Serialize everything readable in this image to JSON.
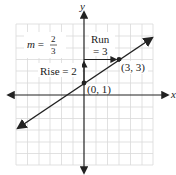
{
  "graph": {
    "axes": {
      "x_label": "x",
      "y_label": "y"
    },
    "grid": {
      "x_min": -6,
      "x_max": 6,
      "y_min": -6,
      "y_max": 6
    },
    "line": {
      "slope_text": "m =",
      "slope_num": "2",
      "slope_den": "3",
      "equation_slope": "2/3",
      "y_intercept": 1
    },
    "points": [
      {
        "label": "(0, 1)",
        "x": 0,
        "y": 1
      },
      {
        "label": "(3, 3)",
        "x": 3,
        "y": 3
      }
    ],
    "rise": {
      "label": "Rise = 2",
      "value": 2
    },
    "run": {
      "label_line1": "Run",
      "label_line2": "= 3",
      "value": 3
    }
  },
  "colors": {
    "grid": "#d9d9d9",
    "axis": "#222222",
    "line": "#222222"
  }
}
